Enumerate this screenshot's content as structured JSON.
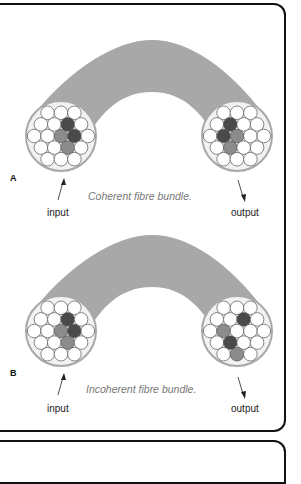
{
  "panels": [
    {
      "id": "A",
      "label": "A",
      "caption": "Coherent fibre bundle.",
      "input_label": "input",
      "output_label": "output",
      "input_fibres": [
        "w",
        "w",
        "w",
        "w",
        "w",
        "d",
        "w",
        "w",
        "w",
        "m",
        "d",
        "w",
        "w",
        "w",
        "m",
        "w",
        "w",
        "w",
        "w"
      ],
      "output_fibres": [
        "w",
        "w",
        "w",
        "w",
        "d",
        "w",
        "w",
        "w",
        "d",
        "m",
        "w",
        "w",
        "w",
        "m",
        "w",
        "w",
        "w",
        "w",
        "w"
      ]
    },
    {
      "id": "B",
      "label": "B",
      "caption": "Incoherent fibre bundle.",
      "input_label": "input",
      "output_label": "output",
      "input_fibres": [
        "w",
        "w",
        "w",
        "w",
        "w",
        "d",
        "w",
        "w",
        "w",
        "m",
        "d",
        "w",
        "w",
        "w",
        "m",
        "w",
        "w",
        "w",
        "w"
      ],
      "output_fibres": [
        "w",
        "w",
        "w",
        "w",
        "w",
        "d",
        "w",
        "w",
        "m",
        "w",
        "w",
        "w",
        "w",
        "d",
        "w",
        "w",
        "w",
        "m",
        "w"
      ]
    }
  ],
  "colors": {
    "bundle": "#a8a8a8",
    "bundle_end": "#f2f2f2",
    "fibre_white": "#ffffff",
    "fibre_dark": "#4a4a4a",
    "fibre_medium": "#8c8c8c",
    "fibre_stroke": "#555555",
    "frame": "#111111"
  },
  "fibre_layout": {
    "row_counts": [
      3,
      4,
      5,
      4,
      3
    ]
  }
}
